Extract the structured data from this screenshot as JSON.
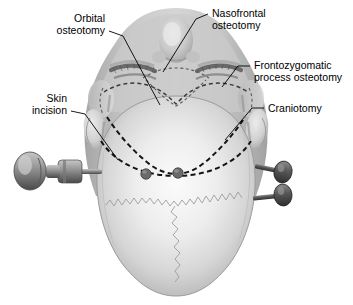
{
  "figure": {
    "view": "superior",
    "background_color": "#ffffff",
    "line_color": "#000000"
  },
  "labels": [
    {
      "id": "orbital-osteotomy",
      "line1": "Orbital",
      "line2": "osteotomy",
      "align": "right",
      "text_x": 105,
      "text_y1": 22,
      "text_y2": 34,
      "leader": "M109,31 L123,36 L160,105"
    },
    {
      "id": "nasofrontal-osteotomy",
      "line1": "Nasofrontal",
      "line2": "osteotomy",
      "align": "left",
      "text_x": 212,
      "text_y1": 17,
      "text_y2": 29,
      "leader": "M208,14 L196,19 L163,72"
    },
    {
      "id": "frontozygomatic-process-osteotomy",
      "line1": "Frontozygomatic",
      "line2": "process osteotomy",
      "align": "left",
      "text_x": 254,
      "text_y1": 69,
      "text_y2": 81,
      "leader": "M250,66 L238,66 L222,87"
    },
    {
      "id": "craniotomy",
      "line1": "Craniotomy",
      "line2": "",
      "align": "left",
      "text_x": 268,
      "text_y1": 112,
      "text_y2": 0,
      "leader": "M264,108 L252,108 L225,140"
    },
    {
      "id": "skin-incision",
      "line1": "Skin",
      "line2": "incision",
      "align": "right",
      "text_x": 67,
      "text_y1": 102,
      "text_y2": 114,
      "leader": "M71,111 L85,114 L118,160"
    }
  ],
  "anatomy": {
    "scalp_highlight": "#f4f4f4",
    "scalp_mid": "#d8d8d8",
    "scalp_edge": "#a9a9a9",
    "face_tone": "#bcbcbc",
    "eyebrow_color": "#6d6d6d",
    "burr_hole_color": "#5f5f5f",
    "burr_holes": [
      {
        "cx": 146,
        "cy": 174,
        "r": 5.2
      },
      {
        "cx": 178,
        "cy": 173,
        "r": 5.2
      }
    ],
    "sutures": [
      {
        "name": "coronal-suture"
      },
      {
        "name": "sagittal-suture"
      }
    ]
  },
  "instruments": {
    "name": "mayfield-skull-clamp-pins",
    "metal_light": "#b4b4b4",
    "metal_mid": "#8a8a8a",
    "metal_dark": "#4e4e4e",
    "pins": [
      {
        "id": "pin-left",
        "side": "left"
      },
      {
        "id": "pin-right-upper",
        "side": "right"
      },
      {
        "id": "pin-right-lower",
        "side": "right"
      }
    ]
  }
}
